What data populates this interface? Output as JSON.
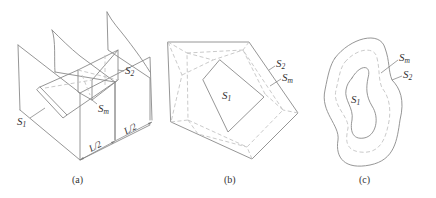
{
  "figure": {
    "panels": [
      {
        "id": "a",
        "caption": "(a)",
        "labels": {
          "s1": {
            "base": "S",
            "sub": "1"
          },
          "s2": {
            "base": "S",
            "sub": "2"
          },
          "sm": {
            "base": "S",
            "sub": "m"
          }
        },
        "dimensions": [
          "L/2",
          "L/2"
        ]
      },
      {
        "id": "b",
        "caption": "(b)",
        "labels": {
          "s1": {
            "base": "S",
            "sub": "1"
          },
          "s2": {
            "base": "S",
            "sub": "2"
          },
          "sm": {
            "base": "S",
            "sub": "m"
          }
        }
      },
      {
        "id": "c",
        "caption": "(c)",
        "labels": {
          "s1": {
            "base": "S",
            "sub": "1"
          },
          "s2": {
            "base": "S",
            "sub": "2"
          },
          "sm": {
            "base": "S",
            "sub": "m"
          }
        }
      }
    ],
    "colors": {
      "solid_line": "#8a8a8a",
      "dashed_line": "#c4c4c4",
      "text": "#333333"
    }
  }
}
